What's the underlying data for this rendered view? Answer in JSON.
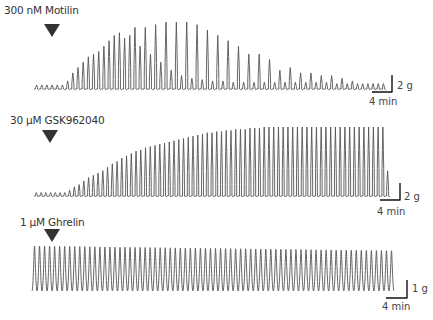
{
  "chart_data": [
    {
      "type": "line",
      "title": "300 nM Motilin",
      "description": "Isometric contraction trace; agonist added at arrow",
      "scale_bar": {
        "amplitude": "2 g",
        "time": "4 min"
      },
      "baseline_cycles": 7,
      "peak_amplitudes_g": [
        0.3,
        0.3,
        0.3,
        0.3,
        0.3,
        0.3,
        0.6,
        1.2,
        1.6,
        2.0,
        2.4,
        2.6,
        2.8,
        3.2,
        3.6,
        4.0,
        4.2,
        3.8,
        4.0,
        4.6,
        3.2,
        4.6,
        2.6,
        4.8,
        2.0,
        5.0,
        1.4,
        5.0,
        1.0,
        5.0,
        0.8,
        4.8,
        0.7,
        4.4,
        0.6,
        4.0,
        0.6,
        3.6,
        0.5,
        3.2,
        0.5,
        2.6,
        0.5,
        2.6,
        0.5,
        2.2,
        0.5,
        1.4,
        0.5,
        1.6,
        0.5,
        1.2,
        0.5,
        1.2,
        0.5,
        1.0,
        0.5,
        1.0,
        0.4,
        0.8,
        0.4,
        0.6,
        0.4,
        0.4,
        0.4,
        0.4,
        0.4,
        0.4
      ]
    },
    {
      "type": "line",
      "title": "30 µM GSK962040",
      "description": "Isometric contraction trace; agonist added at arrow",
      "scale_bar": {
        "amplitude": "2 g",
        "time": "4 min"
      },
      "baseline_cycles": 7,
      "peak_amplitudes_g": [
        0.3,
        0.3,
        0.3,
        0.3,
        0.3,
        0.3,
        0.3,
        0.5,
        0.8,
        1.0,
        1.3,
        1.6,
        1.8,
        2.0,
        2.2,
        2.5,
        2.8,
        3.0,
        3.3,
        3.5,
        3.7,
        3.9,
        4.0,
        4.2,
        4.3,
        4.4,
        4.5,
        4.6,
        4.7,
        4.8,
        4.9,
        5.0,
        5.1,
        5.2,
        5.3,
        5.4,
        5.5,
        5.5,
        5.6,
        5.6,
        5.7,
        5.7,
        5.8,
        5.8,
        5.8,
        5.9,
        5.9,
        5.9,
        6.0,
        6.0,
        6.0,
        6.0,
        6.0,
        6.0,
        6.0,
        6.0,
        6.0,
        6.0,
        6.0,
        6.0,
        6.0,
        6.0,
        6.0,
        6.0,
        6.0,
        6.0,
        6.0,
        6.0,
        6.0,
        6.0,
        6.0,
        6.0,
        6.0,
        6.0,
        2.2
      ]
    },
    {
      "type": "line",
      "title": "1 µM Ghrelin",
      "description": "Isometric contraction trace; no change after agonist",
      "scale_bar": {
        "amplitude": "1 g",
        "time": "4 min"
      },
      "cycles": 72,
      "peak_amplitude_g": 2.0
    }
  ],
  "panels": [
    {
      "label": "300 nM Motilin",
      "scale_g": "2 g",
      "scale_t": "4 min"
    },
    {
      "label": "30 µM GSK962040",
      "scale_g": "2 g",
      "scale_t": "4 min"
    },
    {
      "label": "1 µM Ghrelin",
      "scale_g": "1 g",
      "scale_t": "4 min"
    }
  ],
  "colors": {
    "trace": "#555555",
    "arrow": "#333333",
    "scale_bar": "#111111"
  }
}
